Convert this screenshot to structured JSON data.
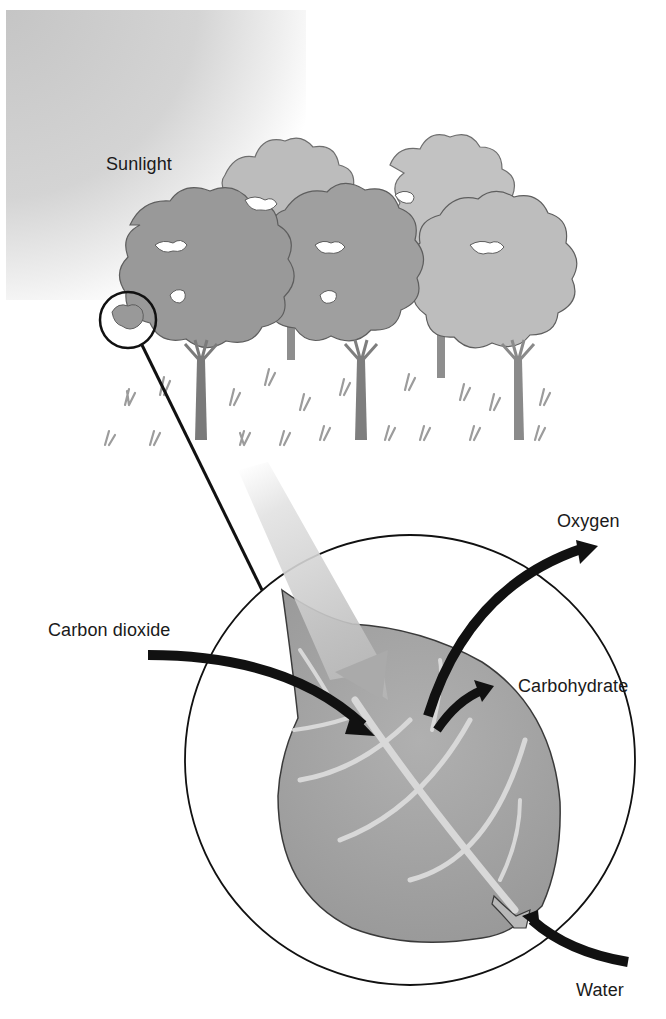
{
  "diagram": {
    "topic": "Photosynthesis",
    "labels": {
      "sunlight": "Sunlight",
      "oxygen": "Oxygen",
      "carbon_dioxide": "Carbon dioxide",
      "carbohydrate": "Carbohydrate",
      "water": "Water"
    },
    "elements": {
      "sky_gradient": "Sunlight shading top-left",
      "trees": [
        "tree-front-left",
        "tree-front-middle",
        "tree-front-right",
        "tree-back-left",
        "tree-back-right"
      ],
      "magnifier": "Circle around leaf cluster linked to enlarged leaf view",
      "leaf": "Enlarged leaf inside large circle",
      "arrows": [
        {
          "name": "sunlight-arrow",
          "direction": "in",
          "from": "top-left"
        },
        {
          "name": "carbon-dioxide-arrow",
          "direction": "in",
          "from": "left"
        },
        {
          "name": "oxygen-arrow",
          "direction": "out",
          "to": "top-right"
        },
        {
          "name": "carbohydrate-arrow",
          "direction": "out",
          "to": "right"
        },
        {
          "name": "water-arrow",
          "direction": "in",
          "from": "bottom-right"
        }
      ]
    },
    "colors": {
      "sky": "#c8c8c8",
      "tree_dark": "#9a9a9a",
      "tree_light": "#bdbdbd",
      "leaf": "#a3a3a3",
      "vein": "#d6d6d6",
      "arrow": "#111111",
      "grass": "#9c9c9c"
    }
  }
}
